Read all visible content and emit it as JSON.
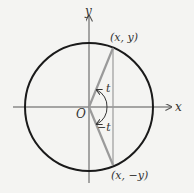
{
  "diagram": {
    "axes": {
      "x_label": "x",
      "y_label": "y",
      "origin_label": "O"
    },
    "points": {
      "upper": "(x, y)",
      "lower": "(x, −y)"
    },
    "angles": {
      "positive": "t",
      "negative": "−t"
    },
    "colors": {
      "background": "#f4f4f2",
      "circle": "#1a1a1a",
      "axes": "#555555",
      "segments": "#9a9a9a"
    }
  }
}
